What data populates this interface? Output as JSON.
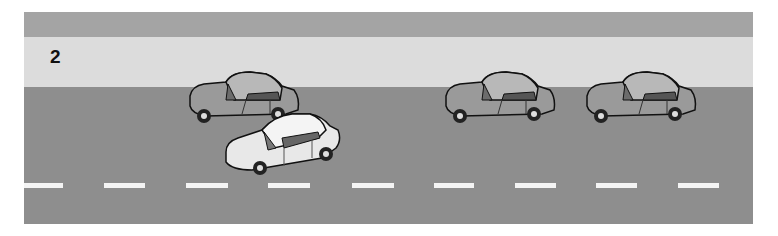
{
  "figure": {
    "label": "2",
    "colors": {
      "top_band": "#a4a4a4",
      "shoulder": "#dcdcdc",
      "road": "#8e8e8e",
      "lane_marking": "#f4f4f4",
      "car_dark": "#9a9a9a",
      "car_light": "#e8e8e8"
    },
    "dashes": [
      {
        "x": 0,
        "w": 39
      },
      {
        "x": 80,
        "w": 41
      },
      {
        "x": 162,
        "w": 42
      },
      {
        "x": 244,
        "w": 42
      },
      {
        "x": 328,
        "w": 42
      },
      {
        "x": 410,
        "w": 40
      },
      {
        "x": 491,
        "w": 41
      },
      {
        "x": 572,
        "w": 41
      },
      {
        "x": 654,
        "w": 41
      }
    ],
    "cars": [
      {
        "name": "car-parked-1",
        "shade": "dark"
      },
      {
        "name": "car-merging",
        "shade": "light"
      },
      {
        "name": "car-parked-2",
        "shade": "dark"
      },
      {
        "name": "car-parked-3",
        "shade": "dark"
      }
    ]
  }
}
